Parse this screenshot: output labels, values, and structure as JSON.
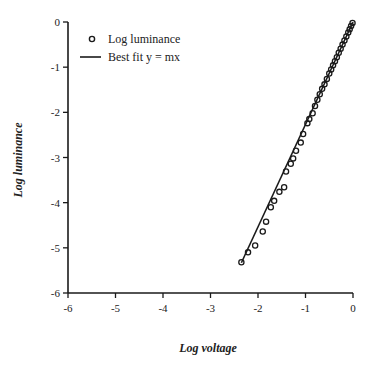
{
  "chart_data": {
    "type": "scatter",
    "title": "",
    "xlabel": "Log voltage",
    "ylabel": "Log luminance",
    "xlim": [
      -6,
      0
    ],
    "ylim": [
      -6,
      0
    ],
    "x_ticks": [
      -6,
      -5,
      -4,
      -3,
      -2,
      -1,
      0
    ],
    "y_ticks": [
      0,
      -1,
      -2,
      -3,
      -4,
      -5,
      -6
    ],
    "x_tick_labels": [
      "-6",
      "-5",
      "-4",
      "-3",
      "-2",
      "-1",
      "0"
    ],
    "y_tick_labels": [
      "0",
      "-1",
      "-2",
      "-3",
      "-4",
      "-5",
      "-6"
    ],
    "grid": false,
    "legend_position": "upper-left",
    "legend": [
      {
        "label": "Log luminance",
        "marker": "open-circle"
      },
      {
        "label": "Best fit y = mx",
        "marker": "line"
      }
    ],
    "series": [
      {
        "name": "Log luminance",
        "type": "scatter",
        "marker": "open-circle",
        "x": [
          -2.35,
          -2.21,
          -2.06,
          -1.9,
          -1.83,
          -1.73,
          -1.66,
          -1.55,
          -1.45,
          -1.41,
          -1.31,
          -1.26,
          -1.2,
          -1.1,
          -1.05,
          -0.96,
          -0.92,
          -0.85,
          -0.8,
          -0.75,
          -0.7,
          -0.65,
          -0.6,
          -0.55,
          -0.5,
          -0.46,
          -0.42,
          -0.38,
          -0.34,
          -0.3,
          -0.26,
          -0.22,
          -0.18,
          -0.14,
          -0.1,
          -0.07,
          -0.04,
          -0.01
        ],
        "y": [
          -5.32,
          -5.1,
          -4.95,
          -4.64,
          -4.42,
          -4.1,
          -3.96,
          -3.76,
          -3.66,
          -3.31,
          -3.14,
          -3.02,
          -2.85,
          -2.67,
          -2.48,
          -2.24,
          -2.15,
          -2.02,
          -1.86,
          -1.72,
          -1.6,
          -1.48,
          -1.38,
          -1.26,
          -1.14,
          -1.05,
          -0.96,
          -0.87,
          -0.78,
          -0.68,
          -0.59,
          -0.5,
          -0.41,
          -0.32,
          -0.23,
          -0.16,
          -0.09,
          -0.02
        ]
      },
      {
        "name": "Best fit y = mx",
        "type": "line",
        "slope": 2.27,
        "x": [
          -2.35,
          0
        ],
        "y": [
          -5.33,
          0
        ]
      }
    ]
  }
}
